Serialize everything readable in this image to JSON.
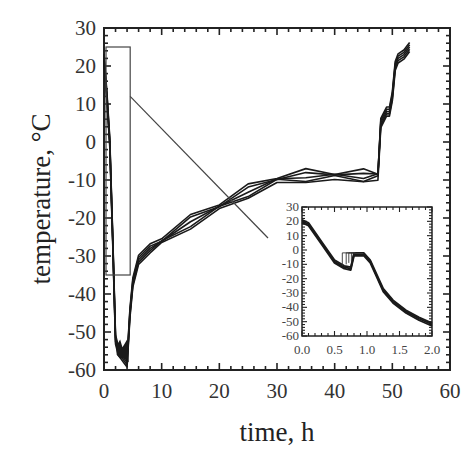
{
  "chart_data": [
    {
      "type": "line",
      "title": "",
      "xlabel": "time, h",
      "ylabel": "temperature, °C",
      "xlim": [
        0,
        60
      ],
      "ylim": [
        -60,
        30
      ],
      "xticks": [
        "0",
        "10",
        "20",
        "30",
        "40",
        "50",
        "60"
      ],
      "yticks": [
        "30",
        "20",
        "10",
        "0",
        "-10",
        "-20",
        "-30",
        "-40",
        "-50",
        "-60"
      ],
      "grid": false,
      "legend": null,
      "series": [
        {
          "name": "temperature (overlaid runs)",
          "x": [
            0,
            0.5,
            1.0,
            1.5,
            2.0,
            2.5,
            3.0,
            3.5,
            4.0,
            4.5,
            5.0,
            6.0,
            8.0,
            10,
            15,
            20,
            25,
            30,
            35,
            40,
            45,
            47.5,
            48.0,
            49.0,
            49.5,
            50.0,
            50.5,
            51.0,
            52.0,
            53.0
          ],
          "y": [
            22,
            12,
            0,
            -25,
            -52,
            -55,
            -56,
            -57,
            -58,
            -45,
            -37,
            -31,
            -28,
            -26,
            -21,
            -17,
            -13,
            -10,
            -9,
            -9,
            -9,
            -9,
            5,
            8,
            8,
            12,
            20,
            22,
            23,
            25
          ]
        }
      ],
      "annotations": [
        {
          "type": "rectangle",
          "label": "zoom region",
          "x_range": [
            0,
            3.5
          ],
          "y_range": [
            -35,
            25
          ]
        },
        {
          "type": "connector-line",
          "from": "zoom region",
          "to": "inset"
        }
      ]
    },
    {
      "type": "line",
      "title": "inset",
      "xlabel": "",
      "ylabel": "",
      "xlim": [
        0.0,
        2.0
      ],
      "ylim": [
        -60,
        30
      ],
      "xticks": [
        "0.0",
        "0.5",
        "1.0",
        "1.5",
        "2.0"
      ],
      "yticks": [
        "30",
        "20",
        "10",
        "0",
        "-10",
        "-20",
        "-30",
        "-40",
        "-50",
        "-60"
      ],
      "series": [
        {
          "name": "temperature (first 2 h)",
          "x": [
            0.0,
            0.1,
            0.3,
            0.5,
            0.65,
            0.75,
            0.8,
            0.95,
            1.05,
            1.15,
            1.25,
            1.4,
            1.6,
            1.8,
            2.0
          ],
          "y": [
            20,
            18,
            5,
            -8,
            -12,
            -13,
            -3,
            -3,
            -8,
            -18,
            -28,
            -36,
            -43,
            -48,
            -52
          ]
        }
      ]
    }
  ]
}
